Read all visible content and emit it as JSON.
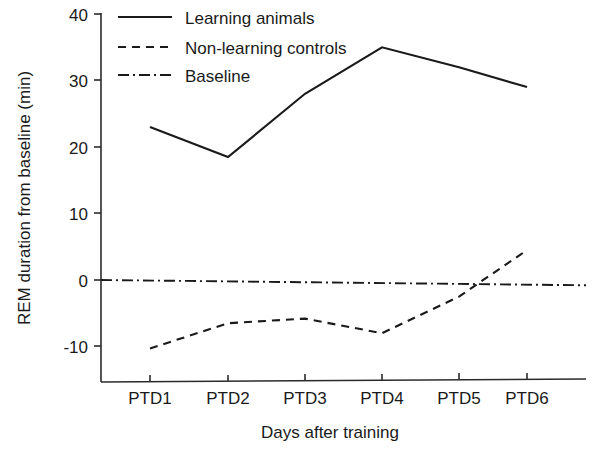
{
  "chart_data": {
    "type": "line",
    "title": "",
    "xlabel": "Days after training",
    "ylabel": "REM duration from baseline (min)",
    "categories": [
      "PTD1",
      "PTD2",
      "PTD3",
      "PTD4",
      "PTD5",
      "PTD6"
    ],
    "ytick_labels": [
      "40",
      "30",
      "20",
      "10",
      "0",
      "-10"
    ],
    "ytick_values": [
      40,
      30,
      20,
      10,
      0,
      -10
    ],
    "ylim": [
      -15,
      40
    ],
    "xlim": [
      0.5,
      6.5
    ],
    "grid": false,
    "legend_position": "top-left",
    "series": [
      {
        "name": "Learning animals",
        "style": "solid",
        "color": "#1a1a1a",
        "values": [
          23,
          18.5,
          28,
          35,
          32,
          29
        ]
      },
      {
        "name": "Non-learning controls",
        "style": "dashed",
        "color": "#1a1a1a",
        "values": [
          -10.3,
          -6.5,
          -5.8,
          -8,
          -2.5,
          4.5
        ]
      },
      {
        "name": "Baseline",
        "style": "dashdot",
        "color": "#1a1a1a",
        "values": [
          0,
          0,
          0,
          0,
          0,
          -0.8
        ]
      }
    ]
  },
  "axes": {
    "y_title": "REM duration from baseline (min)",
    "x_title": "Days after training",
    "y_ticks": [
      {
        "label": "40"
      },
      {
        "label": "30"
      },
      {
        "label": "20"
      },
      {
        "label": "10"
      },
      {
        "label": "0"
      },
      {
        "label": "-10"
      }
    ],
    "x_ticks": [
      {
        "label": "PTD1"
      },
      {
        "label": "PTD2"
      },
      {
        "label": "PTD3"
      },
      {
        "label": "PTD4"
      },
      {
        "label": "PTD5"
      },
      {
        "label": "PTD6"
      }
    ]
  },
  "legend": {
    "items": [
      {
        "label": "Learning animals",
        "style": "solid"
      },
      {
        "label": "Non-learning controls",
        "style": "dashed"
      },
      {
        "label": "Baseline",
        "style": "dashdot"
      }
    ]
  },
  "colors": {
    "ink": "#1a1a1a",
    "axis": "#2b2b2b",
    "background": "#ffffff"
  }
}
